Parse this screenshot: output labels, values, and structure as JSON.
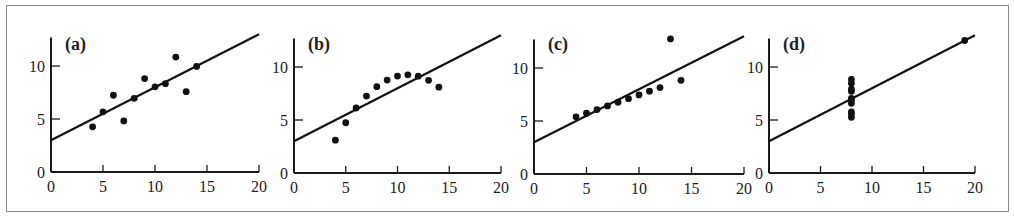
{
  "chart_data": [
    {
      "type": "scatter",
      "panel_label": "(a)",
      "x": [
        10,
        8,
        13,
        9,
        11,
        14,
        6,
        4,
        12,
        7,
        5
      ],
      "y": [
        8.04,
        6.95,
        7.58,
        8.81,
        8.33,
        9.96,
        7.24,
        4.26,
        10.84,
        4.82,
        5.68
      ],
      "fit_line": {
        "intercept": 3,
        "slope": 0.5
      },
      "xlim": [
        0,
        20
      ],
      "ylim": [
        0,
        12.7
      ],
      "xticks": [
        0,
        5,
        10,
        15,
        20
      ],
      "yticks": [
        0,
        5,
        10
      ],
      "xlabel": "",
      "ylabel": "",
      "grid": false
    },
    {
      "type": "scatter",
      "panel_label": "(b)",
      "x": [
        10,
        8,
        13,
        9,
        11,
        14,
        6,
        4,
        12,
        7,
        5
      ],
      "y": [
        9.14,
        8.14,
        8.74,
        8.77,
        9.26,
        8.1,
        6.13,
        3.1,
        9.13,
        7.26,
        4.74
      ],
      "fit_line": {
        "intercept": 3,
        "slope": 0.5
      },
      "xlim": [
        0,
        20
      ],
      "ylim": [
        0,
        12.7
      ],
      "xticks": [
        0,
        5,
        10,
        15,
        20
      ],
      "yticks": [
        0,
        5,
        10
      ],
      "xlabel": "",
      "ylabel": "",
      "grid": false
    },
    {
      "type": "scatter",
      "panel_label": "(c)",
      "x": [
        10,
        8,
        13,
        9,
        11,
        14,
        6,
        4,
        12,
        7,
        5
      ],
      "y": [
        7.46,
        6.77,
        12.74,
        7.11,
        7.81,
        8.84,
        6.08,
        5.39,
        8.15,
        6.42,
        5.73
      ],
      "fit_line": {
        "intercept": 3,
        "slope": 0.5
      },
      "xlim": [
        0,
        20
      ],
      "ylim": [
        0,
        12.7
      ],
      "xticks": [
        0,
        5,
        10,
        15,
        20
      ],
      "yticks": [
        0,
        5,
        10
      ],
      "xlabel": "",
      "ylabel": "",
      "grid": false
    },
    {
      "type": "scatter",
      "panel_label": "(d)",
      "x": [
        8,
        8,
        8,
        8,
        8,
        8,
        8,
        19,
        8,
        8,
        8
      ],
      "y": [
        6.58,
        5.76,
        7.71,
        8.84,
        8.47,
        7.04,
        5.25,
        12.5,
        5.56,
        7.91,
        6.89
      ],
      "fit_line": {
        "intercept": 3,
        "slope": 0.5
      },
      "xlim": [
        0,
        20
      ],
      "ylim": [
        0,
        12.7
      ],
      "xticks": [
        0,
        5,
        10,
        15,
        20
      ],
      "yticks": [
        0,
        5,
        10
      ],
      "xlabel": "",
      "ylabel": "",
      "grid": false
    }
  ],
  "layout": {
    "panels": [
      {
        "origin_x": 51,
        "origin_y": 172,
        "px_per_x": 10.4,
        "px_per_y": 10.6
      },
      {
        "origin_x": 294,
        "origin_y": 173,
        "px_per_x": 10.35,
        "px_per_y": 10.6
      },
      {
        "origin_x": 534,
        "origin_y": 174,
        "px_per_x": 10.5,
        "px_per_y": 10.6
      },
      {
        "origin_x": 769,
        "origin_y": 173,
        "px_per_x": 10.3,
        "px_per_y": 10.6
      }
    ]
  }
}
